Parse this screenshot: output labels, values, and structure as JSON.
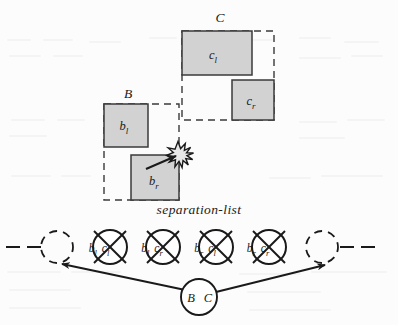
{
  "figure": {
    "title_label": "separation-list",
    "colors": {
      "box_fill": "#d2d2d2",
      "box_stroke": "#3a3a3a",
      "dashed_stroke": "#3a3a3a",
      "line_stroke": "#1a1a1a",
      "background": "#fcfcfc",
      "burst_fill": "#e8e8e8"
    },
    "group_labels": {
      "b_group": "B",
      "c_group": "C"
    },
    "boxes": [
      {
        "id": "cl",
        "label_base": "c",
        "label_sub": "l",
        "x": 182,
        "y": 31,
        "w": 70,
        "h": 44
      },
      {
        "id": "cr",
        "label_base": "c",
        "label_sub": "r",
        "x": 232,
        "y": 80,
        "w": 42,
        "h": 40
      },
      {
        "id": "bl",
        "label_base": "b",
        "label_sub": "l",
        "x": 104,
        "y": 104,
        "w": 44,
        "h": 43
      },
      {
        "id": "br",
        "label_base": "b",
        "label_sub": "r",
        "x": 131,
        "y": 155,
        "w": 48,
        "h": 45
      }
    ],
    "dashed_boxes": [
      {
        "id": "b-bounds",
        "x": 104,
        "y": 104,
        "w": 75,
        "h": 96
      },
      {
        "id": "c-bounds",
        "x": 182,
        "y": 31,
        "w": 92,
        "h": 89
      }
    ],
    "collision": {
      "name": "collision-burst",
      "cx": 178,
      "cy": 155,
      "arrow_from_x": 152,
      "arrow_from_y": 167
    },
    "list": {
      "nodes": [
        {
          "id": "n1",
          "left_base": "b",
          "left_sub": "l",
          "right_base": "c",
          "right_sub": "l",
          "cx": 110,
          "cy": 247
        },
        {
          "id": "n2",
          "left_base": "b",
          "left_sub": "l",
          "right_base": "c",
          "right_sub": "r",
          "cx": 163,
          "cy": 247
        },
        {
          "id": "n3",
          "left_base": "b",
          "left_sub": "r",
          "right_base": "c",
          "right_sub": "l",
          "cx": 216,
          "cy": 247
        },
        {
          "id": "n4",
          "left_base": "b",
          "left_sub": "r",
          "right_base": "c",
          "right_sub": "r",
          "cx": 269,
          "cy": 247
        }
      ],
      "ghost_nodes": [
        {
          "id": "ghost-left",
          "cx": 57,
          "cy": 247
        },
        {
          "id": "ghost-right",
          "cx": 322,
          "cy": 247
        }
      ],
      "pair_node": {
        "id": "pair",
        "left_label": "B",
        "right_label": "C",
        "cx": 199,
        "cy": 297
      }
    }
  }
}
